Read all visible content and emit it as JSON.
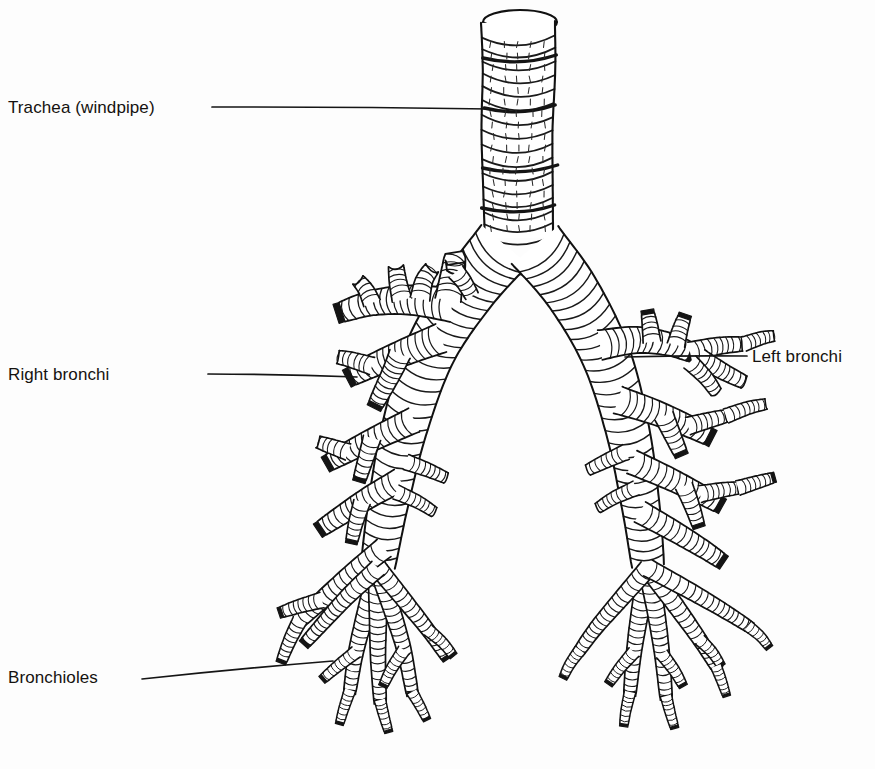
{
  "figure": {
    "kind": "anatomical-line-drawing",
    "style": "black-and-white pen-and-ink scanned illustration",
    "background_color": "#fdfdfd",
    "ink_color": "#151515",
    "width": 875,
    "height": 769
  },
  "labels": {
    "trachea": "Trachea (windpipe)",
    "right_bronchi": "Right bronchi",
    "left_bronchi": "Left bronchi",
    "bronchioles": "Bronchioles"
  },
  "leader_lines": {
    "trachea": {
      "x1": 212,
      "y1": 107,
      "x2": 490,
      "y2": 109
    },
    "right_bronchi": {
      "x1": 208,
      "y1": 374,
      "x2": 357,
      "y2": 377
    },
    "left_bronchi": {
      "x1": 625,
      "y1": 357,
      "x2": 747,
      "y2": 356
    },
    "bronchioles": {
      "x1": 142,
      "y1": 679,
      "x2": 333,
      "y2": 661
    }
  }
}
